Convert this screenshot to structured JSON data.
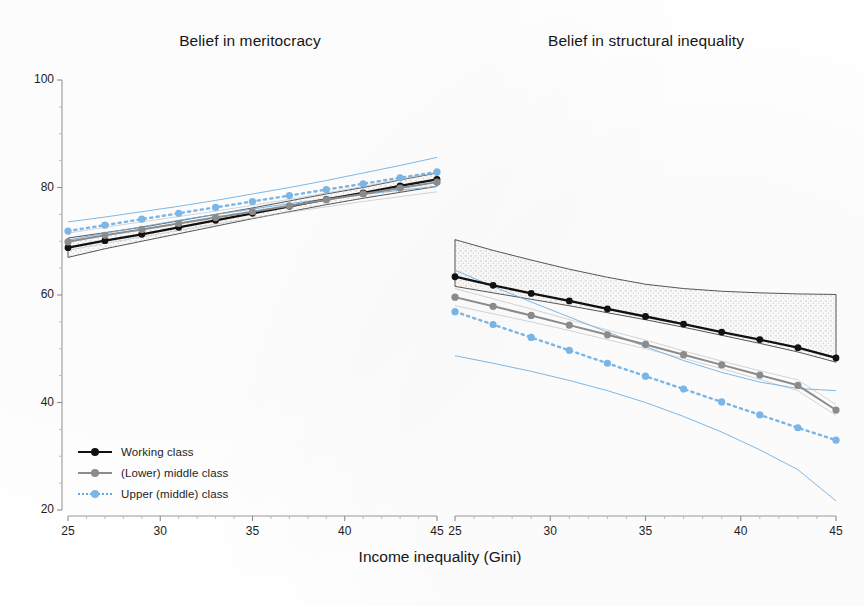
{
  "figure": {
    "xlabel": "Income inequality (Gini)"
  },
  "legend": {
    "items": [
      {
        "label": "Working class",
        "color": "#111111",
        "style": "solid"
      },
      {
        "label": "(Lower) middle class",
        "color": "#8d8d8d",
        "style": "solid"
      },
      {
        "label": "Upper (middle) class",
        "color": "#7bb8ea",
        "style": "dotted"
      }
    ]
  },
  "axes": {
    "y": {
      "ticks": [
        20,
        40,
        60,
        80,
        100
      ],
      "labels": [
        "20",
        "40",
        "60",
        "80",
        "100"
      ],
      "min": 20,
      "max": 100
    },
    "x": {
      "ticks": [
        25,
        30,
        35,
        40,
        45
      ],
      "labels": [
        "25",
        "30",
        "35",
        "40",
        "45"
      ],
      "min": 25,
      "max": 45
    }
  },
  "chart_data": [
    {
      "type": "line",
      "title": "Belief in meritocracy",
      "xlabel": "Income inequality (Gini)",
      "ylabel": "",
      "xlim": [
        25,
        45
      ],
      "ylim": [
        20,
        100
      ],
      "grid": false,
      "legend_position": "bottom-left",
      "x": [
        25,
        27,
        29,
        31,
        33,
        35,
        37,
        39,
        41,
        43,
        45
      ],
      "series": [
        {
          "name": "Working class",
          "color": "#111111",
          "style": "solid",
          "values": [
            68.8,
            70.1,
            71.3,
            72.6,
            73.9,
            75.2,
            76.5,
            77.8,
            79.0,
            80.3,
            81.5
          ],
          "ci_low": [
            67.0,
            68.6,
            70.0,
            71.4,
            72.8,
            74.2,
            75.5,
            76.8,
            78.0,
            79.1,
            80.2
          ],
          "ci_high": [
            70.6,
            71.6,
            72.6,
            73.8,
            75.0,
            76.2,
            77.5,
            78.8,
            80.0,
            81.4,
            82.7
          ]
        },
        {
          "name": "(Lower) middle class",
          "color": "#8d8d8d",
          "style": "solid",
          "values": [
            69.9,
            71.1,
            72.2,
            73.3,
            74.4,
            75.5,
            76.6,
            77.7,
            78.8,
            79.9,
            81.0
          ],
          "ci_low": [
            68.3,
            69.6,
            70.8,
            72.0,
            73.2,
            74.3,
            75.4,
            76.4,
            77.4,
            78.3,
            79.2
          ],
          "ci_high": [
            71.5,
            72.6,
            73.6,
            74.6,
            75.6,
            76.7,
            77.8,
            79.0,
            80.2,
            81.5,
            82.8
          ]
        },
        {
          "name": "Upper (middle) class",
          "color": "#7bb8ea",
          "style": "dotted",
          "values": [
            71.9,
            73.0,
            74.1,
            75.2,
            76.3,
            77.4,
            78.5,
            79.6,
            80.7,
            81.8,
            82.9
          ],
          "ci_low": [
            70.2,
            71.5,
            72.7,
            73.9,
            75.0,
            76.0,
            77.0,
            77.9,
            78.7,
            79.5,
            80.2
          ],
          "ci_high": [
            73.6,
            74.5,
            75.5,
            76.5,
            77.6,
            78.8,
            80.0,
            81.3,
            82.7,
            84.1,
            85.6
          ]
        }
      ]
    },
    {
      "type": "line",
      "title": "Belief in structural inequality",
      "xlabel": "Income inequality (Gini)",
      "ylabel": "",
      "xlim": [
        25,
        45
      ],
      "ylim": [
        20,
        100
      ],
      "grid": false,
      "legend_position": "none",
      "x": [
        25,
        27,
        29,
        31,
        33,
        35,
        37,
        39,
        41,
        43,
        45
      ],
      "series": [
        {
          "name": "Working class",
          "color": "#111111",
          "style": "solid",
          "values": [
            63.4,
            61.8,
            60.3,
            58.9,
            57.4,
            56.0,
            54.6,
            53.1,
            51.7,
            50.2,
            48.3
          ],
          "ci_low": [
            61.6,
            60.4,
            59.2,
            58.0,
            56.7,
            55.4,
            54.0,
            52.5,
            51.0,
            49.4,
            47.5
          ],
          "ci_high": [
            70.3,
            68.3,
            66.5,
            64.8,
            63.3,
            62.0,
            61.2,
            60.7,
            60.4,
            60.2,
            60.1
          ]
        },
        {
          "name": "(Lower) middle class",
          "color": "#8d8d8d",
          "style": "solid",
          "values": [
            59.6,
            57.9,
            56.2,
            54.4,
            52.6,
            50.8,
            48.9,
            47.0,
            45.1,
            43.2,
            38.6
          ],
          "ci_low": [
            58.0,
            56.5,
            55.0,
            53.4,
            51.7,
            50.0,
            48.2,
            46.3,
            44.3,
            42.2,
            37.6
          ],
          "ci_high": [
            61.2,
            59.3,
            57.4,
            55.4,
            53.5,
            51.6,
            49.6,
            47.7,
            45.9,
            44.2,
            39.6
          ]
        },
        {
          "name": "Upper (middle) class",
          "color": "#7bb8ea",
          "style": "dotted",
          "values": [
            56.9,
            54.5,
            52.1,
            49.7,
            47.3,
            44.9,
            42.5,
            40.1,
            37.7,
            35.3,
            33.0
          ],
          "ci_low": [
            48.7,
            47.3,
            45.8,
            44.1,
            42.2,
            40.0,
            37.4,
            34.5,
            31.2,
            27.5,
            21.7
          ],
          "ci_high": [
            64.6,
            61.6,
            58.7,
            55.9,
            53.1,
            50.4,
            47.8,
            45.6,
            43.8,
            42.6,
            42.2
          ]
        }
      ]
    }
  ]
}
